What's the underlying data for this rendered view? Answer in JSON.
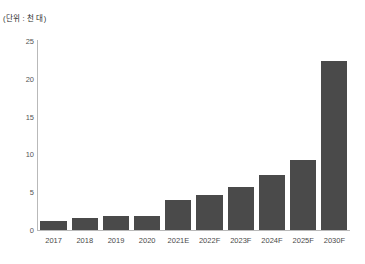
{
  "caption": {
    "unit_note": "(단위 : 천 대)"
  },
  "chart_data": {
    "type": "bar",
    "title": "",
    "subtitle": "",
    "xlabel": "",
    "ylabel": "",
    "unit_note": "(단위 : 천 대)",
    "categories": [
      "2017",
      "2018",
      "2019",
      "2020",
      "2021E",
      "2022F",
      "2023F",
      "2024F",
      "2025F",
      "2030F"
    ],
    "values": [
      1.2,
      1.6,
      1.8,
      1.9,
      4.0,
      4.6,
      5.7,
      7.3,
      9.2,
      22.3
    ],
    "ylim": [
      0,
      25
    ],
    "yticks": [
      0,
      5,
      10,
      15,
      20,
      25
    ],
    "ytick_labels": [
      "0",
      "5",
      "10",
      "15",
      "20",
      "25"
    ],
    "grid": false,
    "legend": null,
    "bar_color": "#4a4a4a",
    "axis_color": "#b9b9b9",
    "label_color": "#4a4a4a"
  }
}
